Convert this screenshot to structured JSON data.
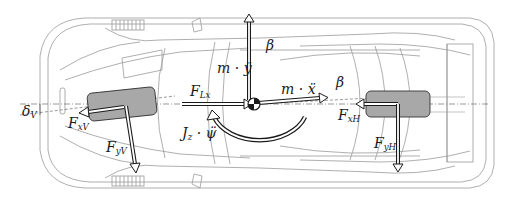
{
  "diagram": {
    "colors": {
      "outline": "#9a9a9a",
      "wheel_fill": "#a8a8a8",
      "arrow": "#1a1a1a",
      "background": "#ffffff"
    },
    "labels": {
      "m_yddot": {
        "main": "m · ÿ",
        "sub": ""
      },
      "beta_top": {
        "main": "β",
        "sub": ""
      },
      "F_Lx": {
        "main": "F",
        "sub": "Lx"
      },
      "m_xddot": {
        "main": "m · ẍ",
        "sub": ""
      },
      "beta_right": {
        "main": "β",
        "sub": ""
      },
      "delta_V": {
        "main": "δ",
        "sub": "V"
      },
      "F_xV": {
        "main": "F",
        "sub": "xV"
      },
      "F_xH": {
        "main": "F",
        "sub": "xH"
      },
      "F_yV": {
        "main": "F",
        "sub": "yV"
      },
      "F_yH": {
        "main": "F",
        "sub": "yH"
      },
      "Jz_psiddot": {
        "main": "J",
        "sub": "z",
        "suffix": " · ψ̈"
      }
    },
    "elements": [
      "front-wheel",
      "rear-wheel",
      "center-of-gravity",
      "longitudinal-force-arrow",
      "lateral-acceleration-arrow",
      "longitudinal-acceleration-arrow",
      "yaw-moment-arc",
      "front-longitudinal-force-arrow",
      "front-lateral-force-arrow",
      "rear-longitudinal-force-arrow",
      "rear-lateral-force-arrow",
      "rear-wing"
    ]
  }
}
